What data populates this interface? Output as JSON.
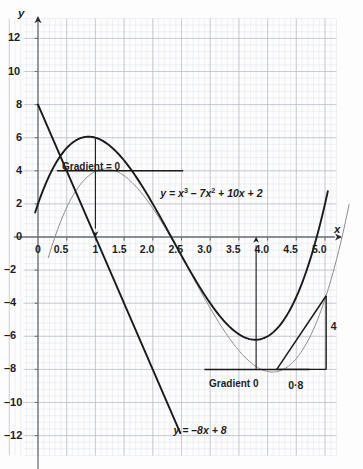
{
  "figure": {
    "kind": "cartesian-graph",
    "axis_x_label": "x",
    "axis_y_label": "y"
  },
  "chart_data": {
    "type": "line",
    "title": "",
    "xlabel": "x",
    "ylabel": "y",
    "xlim": [
      -0.25,
      5.2
    ],
    "ylim": [
      -13.2,
      13.2
    ],
    "grid": true,
    "grid_major_x": 0.5,
    "grid_major_y": 2,
    "grid_minor_x": 0.1,
    "grid_minor_y": 0.4,
    "legend": "none",
    "xticks": [
      "0",
      "0.5",
      "1",
      "1.5",
      "2.0",
      "2.5",
      "3.0",
      "3.5",
      "4.0",
      "4.5",
      "5.0"
    ],
    "xtick_values": [
      0,
      0.5,
      1,
      1.5,
      2,
      2.5,
      3,
      3.5,
      4,
      4.5,
      5
    ],
    "yticks": [
      "12",
      "10",
      "8",
      "6",
      "4",
      "2",
      "0",
      "–2",
      "–4",
      "–6",
      "–8",
      "–10",
      "–12"
    ],
    "ytick_values": [
      12,
      10,
      8,
      6,
      4,
      2,
      0,
      -2,
      -4,
      -6,
      -8,
      -10,
      -12
    ],
    "series": [
      {
        "name": "cubic-bold",
        "label": "y = x³ – 7x² + 10x + 2",
        "kind": "cubic",
        "coeffs": [
          1,
          -7,
          10,
          2
        ],
        "stroke": "#1a1a1a",
        "width": 1.9,
        "x": [
          0,
          0.2,
          0.4,
          0.6,
          0.8,
          0.87,
          1.0,
          1.2,
          1.4,
          1.6,
          1.8,
          2.0,
          2.2,
          2.4,
          2.6,
          2.8,
          3.0,
          3.2,
          3.4,
          3.6,
          3.8,
          3.87,
          4.0,
          4.2,
          4.4,
          4.6,
          4.8,
          5.0
        ],
        "y": [
          2,
          3.73,
          5.06,
          6.3,
          5.63,
          6.06,
          6.0,
          5.65,
          5.02,
          4.18,
          3.15,
          2.0,
          0.77,
          -0.5,
          -1.74,
          -2.93,
          -4.0,
          -4.9,
          -5.58,
          -5.98,
          -6.06,
          -6.06,
          -5.8,
          -5.09,
          -3.85,
          -2.0,
          -0.53,
          2.0
        ]
      },
      {
        "name": "cubic-light",
        "label": "",
        "kind": "cubic-shifted",
        "stroke": "#8c8c8c",
        "width": 1.0,
        "note": "faint companion curve shifted right and down"
      },
      {
        "name": "straight-line",
        "label": "y = –8x + 8",
        "kind": "linear",
        "slope": -8,
        "intercept": 8,
        "stroke": "#1a1a1a",
        "width": 1.9,
        "x": [
          0,
          2.5
        ],
        "y": [
          8,
          -12
        ]
      }
    ],
    "annotations": [
      {
        "name": "gradient-zero-max",
        "text": "Gradient = 0",
        "x": 1.0,
        "y": 4.0,
        "kind": "tangent-horizontal-max"
      },
      {
        "name": "gradient-zero-min",
        "text": "Gradient 0",
        "x": 3.8,
        "y": -8.0,
        "kind": "tangent-horizontal-min"
      },
      {
        "name": "equation-cubic",
        "text": "y = x³ – 7x² + 10x + 2",
        "x": 2.15,
        "y": 2.6
      },
      {
        "name": "equation-line",
        "text": "y = –8x + 8",
        "x": 2.35,
        "y": -11.6
      },
      {
        "name": "triangle-rise",
        "text": "4",
        "x": 5.05,
        "y": -5.6
      },
      {
        "name": "triangle-run",
        "text": "0·8",
        "x": 4.45,
        "y": -8.55
      }
    ]
  },
  "labels": {
    "axis_x": "x",
    "axis_y": "y",
    "equation_cubic_lead": "y = x",
    "equation_cubic_exp1": "3",
    "equation_cubic_mid": " – 7x",
    "equation_cubic_exp2": "2",
    "equation_cubic_tail": " + 10x + 2",
    "equation_line": "y = –8x + 8",
    "gradient_max": "Gradient = 0",
    "gradient_min": "Gradient 0",
    "rise": "4",
    "run": "0·8"
  },
  "xticks": [
    "0",
    "0.5",
    "1",
    "1.5",
    "2.0",
    "2.5",
    "3.0",
    "3.5",
    "4.0",
    "4.5",
    "5.0"
  ],
  "yticks": [
    "12",
    "10",
    "8",
    "6",
    "4",
    "2",
    "0",
    "–2",
    "–4",
    "–6",
    "–8",
    "–10",
    "–12"
  ],
  "colors": {
    "ink": "#1a1a1a",
    "faint_curve": "#8c8c8c",
    "grid_major": "#b9bcc4",
    "grid_minor": "#dfe2e8",
    "axis": "#6e7278",
    "paper": "#fdfdfd"
  }
}
